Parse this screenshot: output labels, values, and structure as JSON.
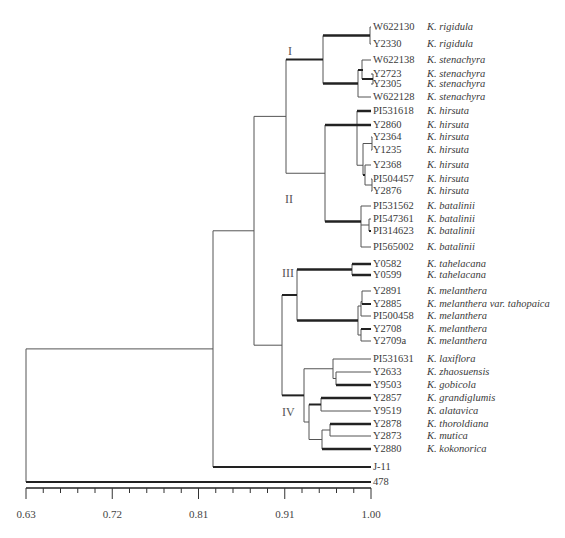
{
  "chart_data": {
    "type": "dendrogram",
    "title": "",
    "xlabel": "",
    "axis": {
      "min": 0.63,
      "max": 1.0,
      "ticks": [
        "0.63",
        "0.72",
        "0.81",
        "0.91",
        "1.00"
      ],
      "minor_ticks_between": 4
    },
    "clusters": [
      {
        "label": "I",
        "x": 288,
        "y": 52
      },
      {
        "label": "II",
        "x": 285,
        "y": 200
      },
      {
        "label": "III",
        "x": 282,
        "y": 274
      },
      {
        "label": "IV",
        "x": 282,
        "y": 413
      }
    ],
    "leaves": [
      {
        "id": "W622130",
        "species": "K. rigidula",
        "y": 27
      },
      {
        "id": "Y2330",
        "species": "K. rigidula",
        "y": 44
      },
      {
        "id": "W622138",
        "species": "K. stenachyra",
        "y": 60
      },
      {
        "id": "Y2723",
        "species": "K. stenachyra",
        "y": 74
      },
      {
        "id": "Y2305",
        "species": "K. stenachyra",
        "y": 84
      },
      {
        "id": "W622128",
        "species": "K. stenachyra",
        "y": 97
      },
      {
        "id": "PI531618",
        "species": "K. hirsuta",
        "y": 111
      },
      {
        "id": "Y2860",
        "species": "K. hirsuta",
        "y": 125
      },
      {
        "id": "Y2364",
        "species": "K. hirsuta",
        "y": 137
      },
      {
        "id": "Y1235",
        "species": "K. hirsuta",
        "y": 150
      },
      {
        "id": "Y2368",
        "species": "K. hirsuta",
        "y": 165
      },
      {
        "id": "PI504457",
        "species": "K. hirsuta",
        "y": 179
      },
      {
        "id": "Y2876",
        "species": "K. hirsuta",
        "y": 191
      },
      {
        "id": "PI531562",
        "species": "K. batalinii",
        "y": 206
      },
      {
        "id": "PI547361",
        "species": "K. batalinii",
        "y": 219
      },
      {
        "id": "PI314623",
        "species": "K. batalinii",
        "y": 231
      },
      {
        "id": "PI565002",
        "species": "K. batalinii",
        "y": 247
      },
      {
        "id": "Y0582",
        "species": "K. tahelacana",
        "y": 264
      },
      {
        "id": "Y0599",
        "species": "K. tahelacana",
        "y": 275
      },
      {
        "id": "Y2891",
        "species": "K. melanthera",
        "y": 291
      },
      {
        "id": "Y2885",
        "species": "K. melanthera var. tahopaica",
        "y": 304
      },
      {
        "id": "PI500458",
        "species": "K. melanthera",
        "y": 316
      },
      {
        "id": "Y2708",
        "species": "K. melanthera",
        "y": 329
      },
      {
        "id": "Y2709a",
        "species": "K. melanthera",
        "y": 341
      },
      {
        "id": "PI531631",
        "species": "K. laxiflora",
        "y": 359
      },
      {
        "id": "Y2633",
        "species": "K. zhaosuensis",
        "y": 372
      },
      {
        "id": "Y9503",
        "species": "K. gobicola",
        "y": 385
      },
      {
        "id": "Y2857",
        "species": "K. grandiglumis",
        "y": 398
      },
      {
        "id": "Y9519",
        "species": "K. alatavica",
        "y": 411
      },
      {
        "id": "Y2878",
        "species": "K. thoroldiana",
        "y": 424
      },
      {
        "id": "Y2873",
        "species": "K. mutica",
        "y": 436
      },
      {
        "id": "Y2880",
        "species": "K. kokonorica",
        "y": 449
      },
      {
        "id": "J-11",
        "species": "",
        "y": 467
      },
      {
        "id": "478",
        "species": "",
        "y": 482
      }
    ]
  }
}
